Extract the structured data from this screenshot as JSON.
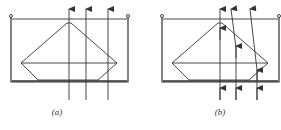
{
  "figure": {
    "panels": [
      {
        "id": "a",
        "label": "(a)",
        "description": "Truncated double cone in vessel; vertical rays pass straight through",
        "rays": "straight"
      },
      {
        "id": "b",
        "label": "(b)",
        "description": "Truncated double cone in vessel; rays refracted at surfaces",
        "rays": "refracted"
      }
    ],
    "colors": {
      "line": "#333333",
      "background": "#ffffff"
    }
  }
}
